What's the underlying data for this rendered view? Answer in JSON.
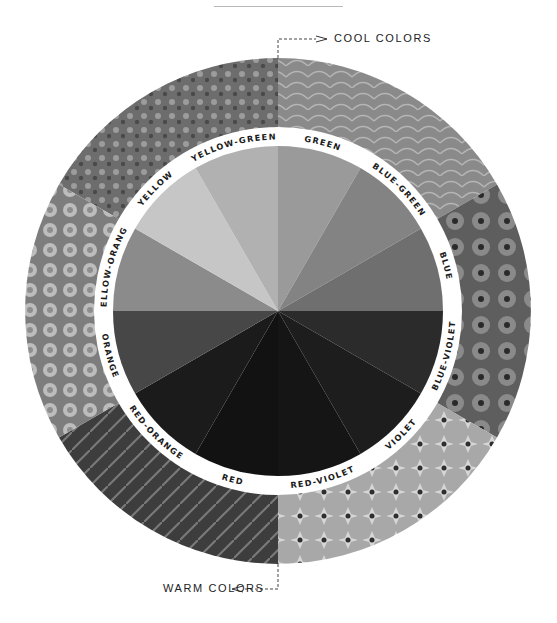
{
  "callouts": {
    "cool": "COOL COLORS",
    "warm": "WARM COLORS"
  },
  "wheel": {
    "center": [
      278,
      311
    ],
    "photo_radius": 253,
    "ring_outer_radius": 184,
    "wheel_radius": 165,
    "segments": [
      {
        "label": "GREEN",
        "start": 0,
        "end": 30,
        "shade": "#9a9a9a",
        "group": "cool"
      },
      {
        "label": "BLUE-GREEN",
        "start": 30,
        "end": 60,
        "shade": "#838383",
        "group": "cool"
      },
      {
        "label": "BLUE",
        "start": 60,
        "end": 90,
        "shade": "#6f6f6f",
        "group": "cool"
      },
      {
        "label": "BLUE-VIOLET",
        "start": 90,
        "end": 120,
        "shade": "#2b2b2b",
        "group": "cool"
      },
      {
        "label": "VIOLET",
        "start": 120,
        "end": 150,
        "shade": "#1d1d1d",
        "group": "cool"
      },
      {
        "label": "RED-VIOLET",
        "start": 150,
        "end": 180,
        "shade": "#151515",
        "group": "cool"
      },
      {
        "label": "RED",
        "start": 180,
        "end": 210,
        "shade": "#121212",
        "group": "warm"
      },
      {
        "label": "RED-ORANGE",
        "start": 210,
        "end": 240,
        "shade": "#1b1b1b",
        "group": "warm"
      },
      {
        "label": "ORANGE",
        "start": 240,
        "end": 270,
        "shade": "#474747",
        "group": "warm"
      },
      {
        "label": "YELLOW-ORANGE",
        "start": 270,
        "end": 300,
        "shade": "#8b8b8b",
        "group": "warm"
      },
      {
        "label": "YELLOW",
        "start": 300,
        "end": 330,
        "shade": "#c6c6c6",
        "group": "warm"
      },
      {
        "label": "YELLOW-GREEN",
        "start": 330,
        "end": 360,
        "shade": "#b1b1b1",
        "group": "warm"
      }
    ],
    "photo_quadrants": [
      {
        "name": "flowers-white-photo",
        "tone": "#7a7a7a"
      },
      {
        "name": "cabbage-leaves-photo",
        "tone": "#8c8c8c"
      },
      {
        "name": "blueberries-photo",
        "tone": "#6a6a6a"
      },
      {
        "name": "star-flowers-photo",
        "tone": "#9a9a9a"
      },
      {
        "name": "beets-photo",
        "tone": "#4a4a4a"
      },
      {
        "name": "marigolds-photo",
        "tone": "#8a8a8a"
      }
    ]
  }
}
